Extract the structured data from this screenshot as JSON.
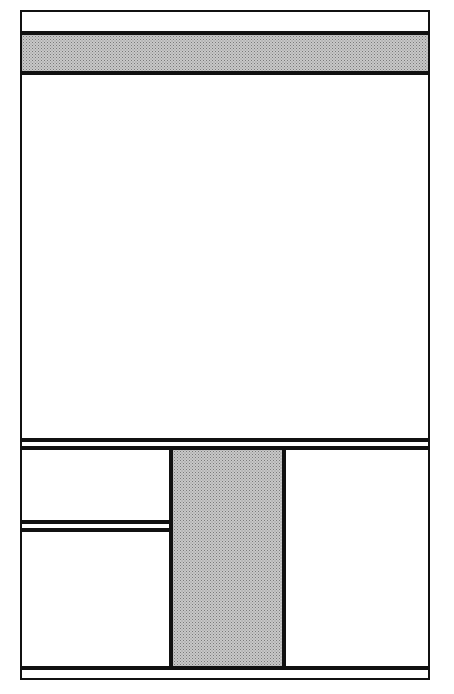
{
  "diagram": {
    "type": "page-layout-wireframe",
    "colors": {
      "line": "#111111",
      "shade": "#c8c8c8",
      "background": "#ffffff"
    },
    "regions": [
      {
        "name": "outer-frame",
        "x": 20,
        "y": 10,
        "w": 410,
        "h": 670,
        "fill": "white"
      },
      {
        "name": "top-strip",
        "x": 20,
        "y": 10,
        "w": 410,
        "h": 23,
        "fill": "white"
      },
      {
        "name": "header-band",
        "x": 20,
        "y": 33,
        "w": 410,
        "h": 40,
        "fill": "shaded"
      },
      {
        "name": "main-panel",
        "x": 20,
        "y": 73,
        "w": 410,
        "h": 367,
        "fill": "white"
      },
      {
        "name": "divider-strip",
        "x": 20,
        "y": 440,
        "w": 410,
        "h": 8,
        "fill": "white"
      },
      {
        "name": "left-upper-panel",
        "x": 20,
        "y": 448,
        "w": 151,
        "h": 74,
        "fill": "white"
      },
      {
        "name": "left-divider-strip",
        "x": 20,
        "y": 522,
        "w": 151,
        "h": 8,
        "fill": "white"
      },
      {
        "name": "left-lower-panel",
        "x": 20,
        "y": 530,
        "w": 151,
        "h": 138,
        "fill": "white"
      },
      {
        "name": "center-column",
        "x": 171,
        "y": 448,
        "w": 113,
        "h": 220,
        "fill": "shaded"
      },
      {
        "name": "right-column",
        "x": 284,
        "y": 448,
        "w": 146,
        "h": 220,
        "fill": "white"
      },
      {
        "name": "footer-strip",
        "x": 20,
        "y": 668,
        "w": 410,
        "h": 12,
        "fill": "white"
      }
    ]
  }
}
